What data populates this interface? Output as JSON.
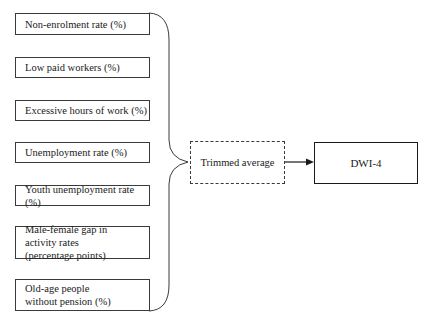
{
  "diagram": {
    "inputs": [
      {
        "label": "Non-enrolment rate (%)"
      },
      {
        "label": "Low paid workers (%)"
      },
      {
        "label": "Excessive hours of work (%)"
      },
      {
        "label": "Unemployment rate (%)"
      },
      {
        "label": "Youth unemployment rate (%)"
      },
      {
        "label": "Male-female gap in activity rates (percentage points)"
      },
      {
        "label": "Old-age people without pension (%)"
      }
    ],
    "aggregator": {
      "label": "Trimmed average"
    },
    "output": {
      "label": "DWI-4"
    }
  }
}
